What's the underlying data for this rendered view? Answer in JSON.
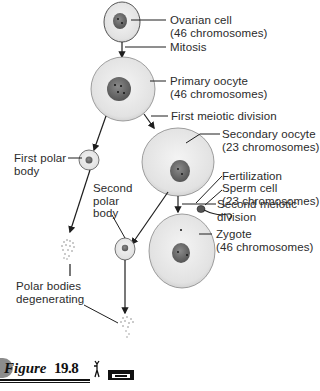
{
  "figure": {
    "label_word": "Figure",
    "label_number": "19.8",
    "icons": [
      "running-figure-icon",
      "videotape-icon"
    ]
  },
  "labels": {
    "ovarian_cell": {
      "name": "Ovarian cell",
      "detail": "(46 chromosomes)"
    },
    "mitosis": "Mitosis",
    "primary_oocyte": {
      "name": "Primary oocyte",
      "detail": "(46 chromosomes)"
    },
    "first_meiotic_division": "First meiotic division",
    "secondary_oocyte": {
      "name": "Secondary oocyte",
      "detail": "(23 chromosomes)"
    },
    "first_polar_body": {
      "line1": "First polar",
      "line2": "body"
    },
    "fertilization": "Fertilization",
    "sperm_cell": {
      "name": "Sperm cell",
      "detail": "(23 chromosomes)"
    },
    "second_polar_body": {
      "line1": "Second",
      "line2": "polar",
      "line3": "body"
    },
    "second_meiotic_division": {
      "line1": "Second meiotic",
      "line2": "division"
    },
    "zygote": {
      "name": "Zygote",
      "detail": "(46 chromosomes)"
    },
    "polar_bodies_degenerating": {
      "line1": "Polar bodies",
      "line2": "degenerating"
    }
  },
  "colors": {
    "cell_fill": "#e4e4e4",
    "nucleus_fill": "#6e6e6e",
    "line": "#1e1e1e",
    "text": "#2b2b2b"
  }
}
